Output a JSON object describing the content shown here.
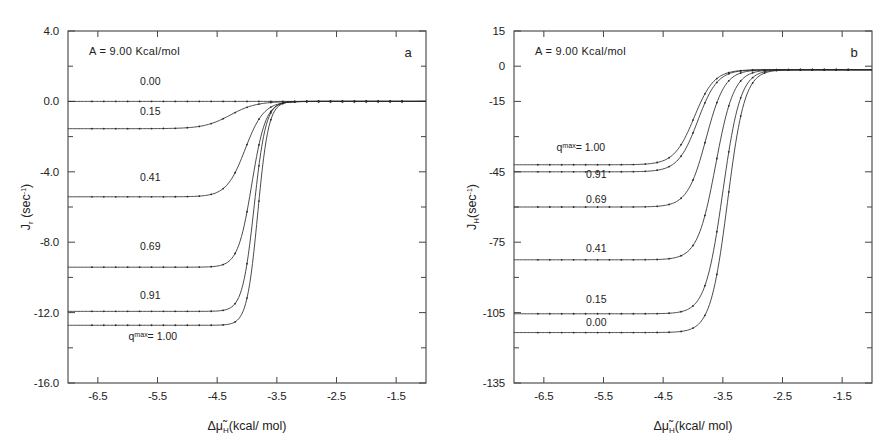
{
  "figure": {
    "background": "#ffffff",
    "ink_color": "#2b2b2b"
  },
  "chart_data": [
    {
      "type": "line",
      "panel_letter": "a",
      "title": "",
      "annotation": "A = 9.00 Kcal/mol",
      "xlabel": "Δμ̃H(kcal/ mol)",
      "xlabel_parts": {
        "delta": "Δ",
        "mu": "μ̃",
        "sub": "H",
        "rest": "(kcal/ mol)"
      },
      "ylabel": "J_r (sec^-1)",
      "ylabel_parts": {
        "base": "J",
        "sub": "r",
        "rest": " (sec",
        "sup": "-1",
        "tail": ")"
      },
      "xlim": [
        -7.0,
        -1.0
      ],
      "ylim": [
        -16.0,
        4.0
      ],
      "xticks": [
        -6.5,
        -5.5,
        -4.5,
        -3.5,
        -2.5,
        -1.5
      ],
      "xtick_labels": [
        "-6.5",
        "-5.5",
        "-4.5",
        "-3.5",
        "-2.5",
        "-1.5"
      ],
      "yticks": [
        4.0,
        0.0,
        -4.0,
        -8.0,
        -12.0,
        -16.0
      ],
      "ytick_labels": [
        "4.0",
        "0.0",
        "-4.0",
        "-8.0",
        "-12.0",
        "-16.0"
      ],
      "yticks_minor": [
        2.0,
        -2.0,
        -6.0,
        -10.0,
        -14.0
      ],
      "grid": false,
      "legend_position": "inline-left",
      "series": [
        {
          "name": "0.00",
          "label": "0.00",
          "label_x": -5.62,
          "label_y": 0.95,
          "plateau": 0.0,
          "top": 0.0,
          "midpoint": -4.05,
          "steepness": 6.5
        },
        {
          "name": "0.15",
          "label": "0.15",
          "label_x": -5.62,
          "label_y": -0.75,
          "plateau": -1.55,
          "top": 0.0,
          "midpoint": -4.28,
          "steepness": 4.6
        },
        {
          "name": "0.41",
          "label": "0.41",
          "label_x": -5.62,
          "label_y": -4.55,
          "plateau": -5.42,
          "top": 0.0,
          "midpoint": -4.03,
          "steepness": 6.4
        },
        {
          "name": "0.69",
          "label": "0.69",
          "label_x": -5.62,
          "label_y": -8.45,
          "plateau": -9.42,
          "top": 0.0,
          "midpoint": -3.92,
          "steepness": 8.6
        },
        {
          "name": "0.91",
          "label": "0.91",
          "label_x": -5.62,
          "label_y": -11.25,
          "plateau": -11.93,
          "top": 0.0,
          "midpoint": -3.88,
          "steepness": 10.2
        },
        {
          "name": "1.00",
          "label": "qᵐᵃˣ= 1.00",
          "label_x": -5.58,
          "label_y": -13.55,
          "plateau": -12.72,
          "top": 0.0,
          "midpoint": -3.82,
          "steepness": 11.0
        }
      ]
    },
    {
      "type": "line",
      "panel_letter": "b",
      "title": "",
      "annotation": "A = 9.00 Kcal/mol",
      "xlabel": "Δμ̃H(kcal/ mol)",
      "xlabel_parts": {
        "delta": "Δ",
        "mu": "μ̃",
        "sub": "H",
        "rest": "(kcal/ mol)"
      },
      "ylabel": "J_H(sec^-1)",
      "ylabel_parts": {
        "base": "J",
        "sub": "H",
        "rest": "(sec",
        "sup": "-1",
        "tail": ")"
      },
      "xlim": [
        -7.0,
        -1.0
      ],
      "ylim": [
        -135.0,
        15.0
      ],
      "xticks": [
        -6.5,
        -5.5,
        -4.5,
        -3.5,
        -2.5,
        -1.5
      ],
      "xtick_labels": [
        "-6.5",
        "-5.5",
        "-4.5",
        "-3.5",
        "-2.5",
        "-1.5"
      ],
      "yticks": [
        15,
        0,
        -15,
        -45,
        -75,
        -105,
        -135
      ],
      "ytick_labels": [
        "15",
        "0",
        "-15",
        "-45",
        "-75",
        "-105",
        "-135"
      ],
      "yticks_minor": [
        -30,
        -60,
        -90,
        -120
      ],
      "grid": false,
      "legend_position": "inline-left",
      "series": [
        {
          "name": "1.00",
          "label": "qᵐᵃˣ= 1.00",
          "label_x": -5.88,
          "label_y": -36.0,
          "plateau": -42.0,
          "top": -1.5,
          "midpoint": -3.98,
          "steepness": 6.0
        },
        {
          "name": "0.91",
          "label": "0.91",
          "label_x": -5.62,
          "label_y": -47.5,
          "plateau": -45.0,
          "top": -1.5,
          "midpoint": -3.92,
          "steepness": 6.1
        },
        {
          "name": "0.69",
          "label": "0.69",
          "label_x": -5.62,
          "label_y": -58.5,
          "plateau": -60.0,
          "top": -1.5,
          "midpoint": -3.78,
          "steepness": 6.4
        },
        {
          "name": "0.41",
          "label": "0.41",
          "label_x": -5.62,
          "label_y": -79.0,
          "plateau": -82.5,
          "top": -1.5,
          "midpoint": -3.62,
          "steepness": 6.6
        },
        {
          "name": "0.15",
          "label": "0.15",
          "label_x": -5.62,
          "label_y": -101.0,
          "plateau": -105.5,
          "top": -1.5,
          "midpoint": -3.5,
          "steepness": 6.8
        },
        {
          "name": "0.00",
          "label": "0.00",
          "label_x": -5.62,
          "label_y": -110.5,
          "plateau": -113.5,
          "top": -1.5,
          "midpoint": -3.42,
          "steepness": 7.0
        }
      ]
    }
  ]
}
